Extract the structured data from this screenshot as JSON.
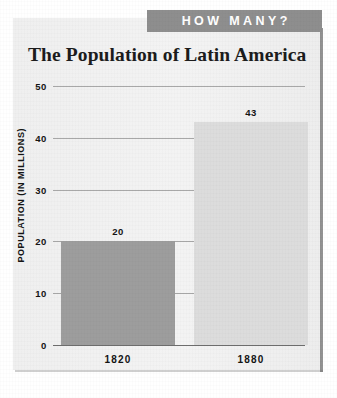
{
  "banner": {
    "label": "HOW MANY?",
    "background_color": "#8e8e8e",
    "text_color": "#ffffff"
  },
  "card": {
    "background_color": "#f1f1f1"
  },
  "chart_data": {
    "type": "bar",
    "title": "The Population of Latin America",
    "xlabel": "",
    "ylabel": "POPULATION (IN MILLIONS)",
    "categories": [
      "1820",
      "1880"
    ],
    "values": [
      20,
      43
    ],
    "value_labels": [
      "20",
      "43"
    ],
    "ylim": [
      0,
      50
    ],
    "yticks": [
      0,
      10,
      20,
      30,
      40,
      50
    ],
    "ytick_labels": [
      "0",
      "10",
      "20",
      "30",
      "40",
      "50"
    ],
    "grid": true,
    "legend": false,
    "bar_colors": [
      "#9d9d9d",
      "#dcdcdc"
    ],
    "series": [
      {
        "name": "Population",
        "values": [
          20,
          43
        ]
      }
    ]
  }
}
